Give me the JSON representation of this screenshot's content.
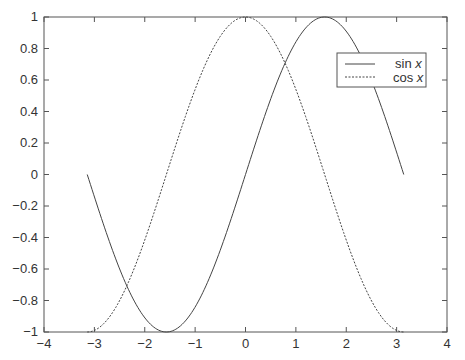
{
  "chart_data": {
    "type": "line",
    "title": "",
    "xlabel": "",
    "ylabel": "",
    "xlim": [
      -4,
      4
    ],
    "ylim": [
      -1,
      1
    ],
    "xticks": [
      -4,
      -3,
      -2,
      -1,
      0,
      1,
      2,
      3,
      4
    ],
    "yticks": [
      -1,
      -0.8,
      -0.6,
      -0.4,
      -0.2,
      0,
      0.2,
      0.4,
      0.6,
      0.8,
      1
    ],
    "xtick_labels": [
      "−4",
      "−3",
      "−2",
      "−1",
      "0",
      "1",
      "2",
      "3",
      "4"
    ],
    "ytick_labels": [
      "−1",
      "−0.8",
      "−0.6",
      "−0.4",
      "−0.2",
      "0",
      "0.2",
      "0.4",
      "0.6",
      "0.8",
      "1"
    ],
    "grid": false,
    "legend_position": "top-right",
    "x_domain": [
      -3.14159,
      3.14159
    ],
    "series": [
      {
        "name": "sin x",
        "function": "sin",
        "style": "solid",
        "color": "#444444"
      },
      {
        "name": "cos x",
        "function": "cos",
        "style": "dashed",
        "color": "#444444"
      }
    ],
    "legend": [
      {
        "label": "sin ",
        "var": "x",
        "style": "solid"
      },
      {
        "label": "cos ",
        "var": "x",
        "style": "dashed"
      }
    ]
  }
}
